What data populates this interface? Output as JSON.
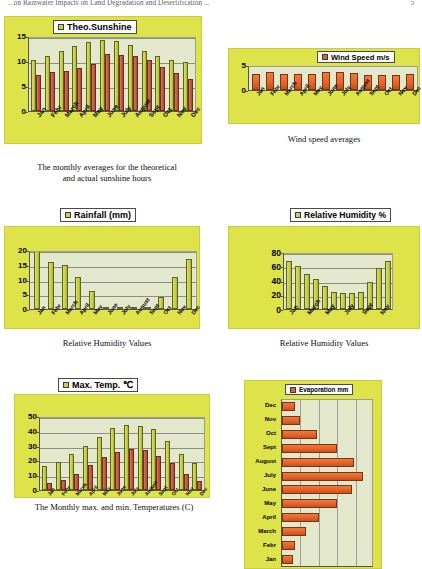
{
  "header": {
    "title": "...on Rainwater Impacts on Land Degradation and Desertification ...",
    "page": "5"
  },
  "figures": [
    {
      "id": "fig1",
      "legend": "Theo.Sunshine",
      "legend_marker": "olive-square",
      "caption": "The monthly averages for the theoretical and actual sunshine hours",
      "caption_line1": "The monthly averages for the theoretical",
      "caption_line2": "and actual sunshine hours"
    },
    {
      "id": "fig2",
      "legend": "Wind Speed m/s",
      "legend_marker": "orange-square",
      "caption": "Wind speed averages"
    },
    {
      "id": "fig3",
      "legend": "Rainfall (mm)",
      "legend_marker": "olive-square",
      "caption": "Relative Humidity Values"
    },
    {
      "id": "fig4",
      "legend": "Relative Humidity %",
      "legend_marker": "olive-square",
      "caption": "Relative Humidity Values"
    },
    {
      "id": "fig5",
      "legend": "Max. Temp. ℃",
      "legend_marker": "olive-square",
      "caption": "The Monthly max. and min. Temperatures (C)"
    },
    {
      "id": "fig6",
      "legend": "Evaporation mm",
      "legend_marker": "orange-square",
      "caption": ""
    }
  ],
  "colors": {
    "panel": "#dfe34a",
    "plot": "#e3e8cd",
    "series_olive": "#c9d14a",
    "series_red": "#c65a42",
    "series_orange": "#e2622a",
    "page": "#ffffff"
  },
  "chart_data": [
    {
      "type": "bar",
      "title": "Theo.Sunshine",
      "xlabel": "",
      "ylabel": "",
      "ylim": [
        0,
        15
      ],
      "yticks": [
        0,
        5,
        10,
        15
      ],
      "grid": true,
      "legend_position": "top",
      "categories": [
        "Jan",
        "Febr",
        "March",
        "April",
        "May",
        "June",
        "July",
        "August",
        "Sept",
        "Oct",
        "Nov",
        "Dec"
      ],
      "series": [
        {
          "name": "Theo.Sunshine",
          "values": [
            10.3,
            11.1,
            12.0,
            13.0,
            13.8,
            14.2,
            14.0,
            13.2,
            12.1,
            11.0,
            10.2,
            9.9
          ]
        },
        {
          "name": "Actual Sunshine",
          "values": [
            7.2,
            7.8,
            8.0,
            8.6,
            9.4,
            11.4,
            11.3,
            11.0,
            10.3,
            8.8,
            7.6,
            6.5
          ]
        }
      ]
    },
    {
      "type": "bar",
      "title": "Wind Speed m/s",
      "xlabel": "",
      "ylabel": "",
      "ylim": [
        0,
        5
      ],
      "yticks": [
        0,
        5
      ],
      "grid": false,
      "legend_position": "top",
      "categories": [
        "Jan",
        "Febr",
        "March",
        "April",
        "May",
        "June",
        "July",
        "August",
        "Sept",
        "Oct",
        "Nov",
        "Dec"
      ],
      "series": [
        {
          "name": "Wind Speed m/s",
          "values": [
            3.3,
            3.6,
            3.3,
            3.2,
            3.3,
            3.6,
            3.7,
            3.4,
            3.1,
            3.1,
            3.1,
            3.2
          ]
        }
      ]
    },
    {
      "type": "bar",
      "title": "Rainfall (mm)",
      "xlabel": "",
      "ylabel": "",
      "ylim": [
        0,
        20
      ],
      "yticks": [
        0,
        5,
        10,
        15,
        20
      ],
      "grid": true,
      "legend_position": "top",
      "categories": [
        "Jan",
        "Febr",
        "March",
        "April",
        "May",
        "June",
        "July",
        "August",
        "Sept",
        "Oct",
        "Nov",
        "Dec"
      ],
      "series": [
        {
          "name": "Rainfall (mm)",
          "values": [
            21.0,
            16.0,
            15.0,
            11.0,
            6.0,
            0.2,
            0.1,
            0.1,
            0.2,
            4.0,
            11.0,
            17.0
          ]
        }
      ]
    },
    {
      "type": "bar",
      "title": "Relative Humidity %",
      "xlabel": "",
      "ylabel": "",
      "ylim": [
        0,
        80
      ],
      "yticks": [
        0,
        20,
        40,
        60,
        80
      ],
      "grid": true,
      "legend_position": "top",
      "categories": [
        "Jan",
        "Febr",
        "March",
        "April",
        "May",
        "June",
        "July",
        "August",
        "Sept",
        "Oct",
        "Nov",
        "Dec"
      ],
      "tick_labels": [
        "Jan",
        "March",
        "May",
        "July",
        "Sept",
        "Nov"
      ],
      "series": [
        {
          "name": "Relative Humidity %",
          "values": [
            68,
            60,
            49,
            42,
            32,
            24,
            22,
            22,
            24,
            38,
            57,
            67
          ]
        }
      ]
    },
    {
      "type": "bar",
      "title": "Max. Temp. ℃",
      "xlabel": "",
      "ylabel": "",
      "ylim": [
        0,
        50
      ],
      "yticks": [
        0,
        10,
        20,
        30,
        40,
        50
      ],
      "grid": true,
      "legend_position": "top",
      "categories": [
        "Jan",
        "Febr",
        "March",
        "April",
        "May",
        "June",
        "July",
        "August",
        "Sept",
        "Oct",
        "Nov",
        "Dec"
      ],
      "series": [
        {
          "name": "Max. Temp. ℃",
          "values": [
            16,
            19,
            24,
            30,
            36,
            42,
            44,
            43,
            41,
            33,
            24,
            18
          ]
        },
        {
          "name": "Min. Temp. ℃",
          "values": [
            5,
            7,
            11,
            17,
            22,
            26,
            28,
            27,
            23,
            18,
            11,
            6
          ]
        }
      ]
    },
    {
      "type": "bar",
      "orientation": "horizontal",
      "title": "Evaporation mm",
      "xlabel": "",
      "ylabel": "",
      "grid": true,
      "legend_position": "top",
      "categories": [
        "Dec",
        "Nov",
        "Oct",
        "Sept",
        "August",
        "July",
        "June",
        "May",
        "April",
        "March",
        "Febr",
        "Jan"
      ],
      "series": [
        {
          "name": "Evaporation mm",
          "values": [
            14,
            20,
            38,
            60,
            78,
            88,
            76,
            60,
            40,
            26,
            14,
            12
          ]
        }
      ]
    }
  ]
}
